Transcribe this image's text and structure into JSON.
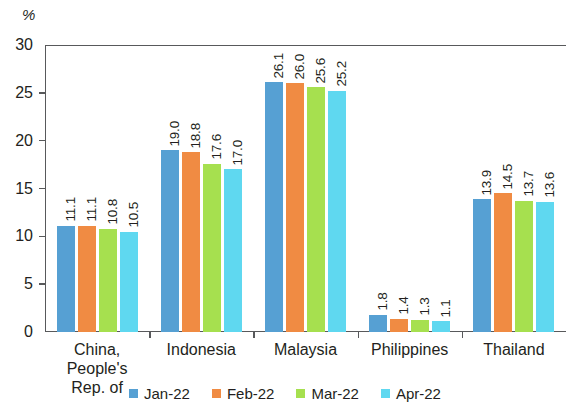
{
  "chart_data": {
    "type": "bar",
    "title": "",
    "subtitle": "",
    "xlabel": "",
    "ylabel": "%",
    "unit_label": "%",
    "ylim": [
      0,
      30
    ],
    "yticks": [
      0,
      5,
      10,
      15,
      20,
      25,
      30
    ],
    "ytick_labels": [
      "0",
      "5",
      "10",
      "15",
      "20",
      "25",
      "30"
    ],
    "grid": false,
    "legend_position": "bottom-center",
    "categories": [
      "China, People's Rep. of",
      "Indonesia",
      "Malaysia",
      "Philippines",
      "Thailand"
    ],
    "category_lines": [
      [
        "China, People's",
        "Rep. of"
      ],
      [
        "Indonesia"
      ],
      [
        "Malaysia"
      ],
      [
        "Philippines"
      ],
      [
        "Thailand"
      ]
    ],
    "series": [
      {
        "name": "Jan-22",
        "color": "#56a0d3",
        "values": [
          11.1,
          19.0,
          26.1,
          1.8,
          13.9
        ],
        "labels": [
          "11.1",
          "19.0",
          "26.1",
          "1.8",
          "13.9"
        ]
      },
      {
        "name": "Feb-22",
        "color": "#f08b43",
        "values": [
          11.1,
          18.8,
          26.0,
          1.4,
          14.5
        ],
        "labels": [
          "11.1",
          "18.8",
          "26.0",
          "1.4",
          "14.5"
        ]
      },
      {
        "name": "Mar-22",
        "color": "#a6e04f",
        "values": [
          10.8,
          17.6,
          25.6,
          1.3,
          13.7
        ],
        "labels": [
          "10.8",
          "17.6",
          "25.6",
          "1.3",
          "13.7"
        ]
      },
      {
        "name": "Apr-22",
        "color": "#5fd8f0",
        "values": [
          10.5,
          17.0,
          25.2,
          1.1,
          13.6
        ],
        "labels": [
          "10.5",
          "17.0",
          "25.2",
          "1.1",
          "13.6"
        ]
      }
    ]
  }
}
